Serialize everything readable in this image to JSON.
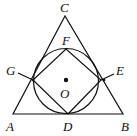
{
  "diagram": {
    "type": "geometry",
    "stroke_color": "#111111",
    "points": {
      "A": {
        "label": "A",
        "x": 13,
        "y": 114
      },
      "B": {
        "label": "B",
        "x": 123,
        "y": 114
      },
      "C": {
        "label": "C",
        "x": 65,
        "y": 16
      },
      "D": {
        "label": "D",
        "x": 68,
        "y": 114
      },
      "E": {
        "label": "E",
        "x": 101,
        "y": 80
      },
      "F": {
        "label": "F",
        "x": 66,
        "y": 49
      },
      "G": {
        "label": "G",
        "x": 33,
        "y": 80
      },
      "O": {
        "label": "O",
        "x": 66,
        "y": 81
      }
    },
    "circle": {
      "center": "O",
      "cx": 66,
      "cy": 81,
      "r": 32.5
    },
    "labels": [
      {
        "text": "C",
        "x": 60,
        "y": 12
      },
      {
        "text": "F",
        "x": 62,
        "y": 45
      },
      {
        "text": "G",
        "x": 6,
        "y": 75
      },
      {
        "text": "E",
        "x": 116,
        "y": 75
      },
      {
        "text": "O",
        "x": 60,
        "y": 98
      },
      {
        "text": "A",
        "x": 6,
        "y": 131
      },
      {
        "text": "D",
        "x": 63,
        "y": 131
      },
      {
        "text": "B",
        "x": 121,
        "y": 131
      }
    ]
  }
}
